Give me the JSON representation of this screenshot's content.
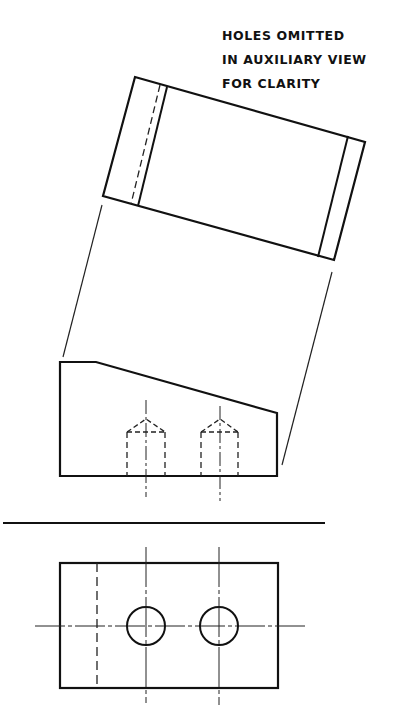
{
  "note": {
    "lines": [
      "HOLES OMITTED",
      "IN AUXILIARY VIEW",
      "FOR CLARITY"
    ]
  },
  "views": {
    "auxiliary_view": {
      "label": "Auxiliary view (holes omitted)",
      "outline": [
        [
          135,
          77
        ],
        [
          365,
          142
        ],
        [
          334,
          260
        ],
        [
          103,
          196
        ]
      ],
      "visible_edge_left": [
        [
          167,
          87
        ],
        [
          138,
          206
        ]
      ],
      "hidden_edge_left": [
        [
          160,
          85
        ],
        [
          131,
          204
        ]
      ],
      "visible_edge_right": [
        [
          348,
          136
        ],
        [
          318,
          257
        ]
      ]
    },
    "projection_lines": [
      [
        [
          102,
          205
        ],
        [
          63,
          357
        ]
      ],
      [
        [
          332,
          272
        ],
        [
          282,
          465
        ]
      ]
    ],
    "front_view": {
      "outline": [
        [
          60,
          362
        ],
        [
          96,
          362
        ],
        [
          277,
          413
        ],
        [
          277,
          476
        ],
        [
          60,
          476
        ]
      ],
      "holes": [
        {
          "center_x": 146,
          "left": 127,
          "right": 165,
          "shoulder_y": 432,
          "tip_y": 419,
          "bottom_y": 476,
          "centerline": [
            400,
            497
          ]
        },
        {
          "center_x": 220,
          "left": 201,
          "right": 238,
          "shoulder_y": 432,
          "tip_y": 419,
          "bottom_y": 476,
          "centerline": [
            406,
            501
          ]
        }
      ]
    },
    "fold_line": [
      [
        3,
        523
      ],
      [
        325,
        523
      ]
    ],
    "top_view": {
      "rect": {
        "x": 60,
        "y": 563,
        "width": 218,
        "height": 125
      },
      "hidden_line_x": 97,
      "horizontal_centerline": {
        "y": 626,
        "x1": 35,
        "x2": 307
      },
      "holes": [
        {
          "cx": 146,
          "cy": 626,
          "r": 19,
          "centerline": [
            547,
            703
          ]
        },
        {
          "cx": 219,
          "cy": 626,
          "r": 19,
          "centerline": [
            547,
            705
          ]
        }
      ]
    }
  }
}
